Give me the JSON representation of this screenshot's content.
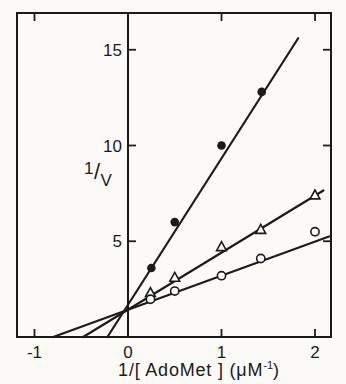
{
  "figure": {
    "background": "#fbfaf7",
    "ink": "#1b1b1b",
    "ylabel_parts": {
      "numerator": "1",
      "slash": "/",
      "denominator": "V"
    },
    "xlabel_parts": {
      "main": "1/[ AdoMet ]",
      "open": " (",
      "unit": "μM",
      "sup": "-1",
      "close": ")"
    }
  },
  "chart_data": {
    "type": "scatter",
    "title": "",
    "xlabel": "1/[ AdoMet ] (μM⁻¹)",
    "ylabel": "1/V",
    "xlim": [
      -1.19,
      2.17
    ],
    "ylim": [
      0,
      16.9
    ],
    "grid": false,
    "legend": "none",
    "x_ticks": [
      {
        "value": -1,
        "label": "-1"
      },
      {
        "value": 0,
        "label": "0"
      },
      {
        "value": 1,
        "label": "1"
      },
      {
        "value": 2,
        "label": "2"
      }
    ],
    "y_ticks": [
      {
        "value": 5,
        "label": "5"
      },
      {
        "value": 10,
        "label": "10"
      },
      {
        "value": 15,
        "label": "15"
      }
    ],
    "series": [
      {
        "name": "filled-circle-series",
        "marker": "filled-circle",
        "points": [
          [
            0.25,
            3.6
          ],
          [
            0.5,
            6.0
          ],
          [
            1.0,
            10.0
          ],
          [
            1.43,
            12.8
          ]
        ],
        "line": {
          "x1": -0.22,
          "y1": 0,
          "x2": 1.82,
          "y2": 15.6
        },
        "x_intercept": -0.22
      },
      {
        "name": "open-triangle-series",
        "marker": "open-triangle",
        "points": [
          [
            0.24,
            2.3
          ],
          [
            0.5,
            3.1
          ],
          [
            1.0,
            4.7
          ],
          [
            1.42,
            5.6
          ],
          [
            2.0,
            7.4
          ]
        ],
        "line": {
          "x1": -0.48,
          "y1": 0,
          "x2": 2.09,
          "y2": 7.65
        },
        "x_intercept": -0.48
      },
      {
        "name": "open-circle-series",
        "marker": "open-circle",
        "points": [
          [
            0.24,
            1.97
          ],
          [
            0.5,
            2.4
          ],
          [
            1.0,
            3.2
          ],
          [
            1.42,
            4.1
          ],
          [
            2.0,
            5.5
          ]
        ],
        "line": {
          "x1": -0.8,
          "y1": 0,
          "x2": 2.15,
          "y2": 5.25
        },
        "x_intercept": -0.8
      }
    ]
  }
}
